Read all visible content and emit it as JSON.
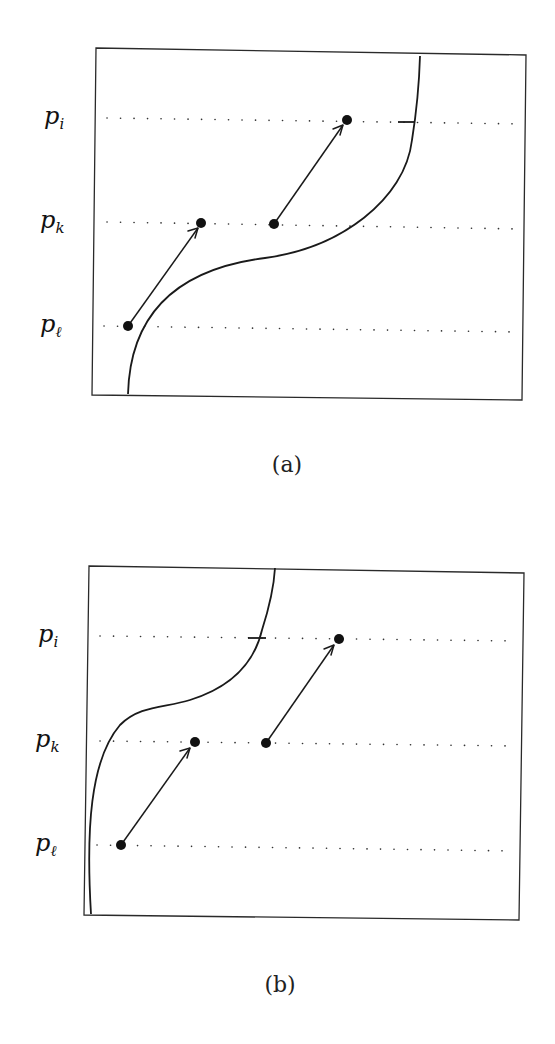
{
  "figure": {
    "panels": [
      {
        "id": "a",
        "caption": "(a)",
        "levels": [
          {
            "name": "p_i",
            "base": "p",
            "subscript": "i"
          },
          {
            "name": "p_k",
            "base": "p",
            "subscript": "k"
          },
          {
            "name": "p_l",
            "base": "p",
            "subscript": "ℓ"
          }
        ],
        "arrows": [
          {
            "from": "p_l",
            "to": "p_k",
            "description": "arrow from point on p_ℓ left of curve to point on p_k"
          },
          {
            "from": "p_k",
            "to": "p_i",
            "description": "arrow from point on p_k near curve to point on p_i left of curve"
          }
        ],
        "curve": "S-shaped curve from bottom-left to top-right, crossing p_i with tick mark"
      },
      {
        "id": "b",
        "caption": "(b)",
        "levels": [
          {
            "name": "p_i",
            "base": "p",
            "subscript": "i"
          },
          {
            "name": "p_k",
            "base": "p",
            "subscript": "k"
          },
          {
            "name": "p_l",
            "base": "p",
            "subscript": "ℓ"
          }
        ],
        "arrows": [
          {
            "from": "p_l",
            "to": "p_k",
            "description": "arrow from point on p_ℓ right of curve to point on p_k"
          },
          {
            "from": "p_k",
            "to": "p_i",
            "description": "arrow from point on p_k to point on p_i right of curve"
          }
        ],
        "curve": "S-shaped curve hugging left edge, crossing p_i with tick mark"
      }
    ]
  }
}
